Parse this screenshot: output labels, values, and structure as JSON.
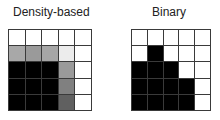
{
  "panels": [
    {
      "title": "Density-based",
      "rows": 5,
      "cols": 5,
      "cells": [
        [
          "#ffffff",
          "#ffffff",
          "#ffffff",
          "#ffffff",
          "#ffffff"
        ],
        [
          "#a8a8a8",
          "#9a9a9a",
          "#a6a6a6",
          "#ececec",
          "#ffffff"
        ],
        [
          "#000000",
          "#000000",
          "#000000",
          "#9a9a9a",
          "#ffffff"
        ],
        [
          "#000000",
          "#000000",
          "#000000",
          "#808080",
          "#ffffff"
        ],
        [
          "#000000",
          "#000000",
          "#000000",
          "#606060",
          "#ffffff"
        ]
      ]
    },
    {
      "title": "Binary",
      "rows": 5,
      "cols": 5,
      "cells": [
        [
          "#ffffff",
          "#ffffff",
          "#ffffff",
          "#ffffff",
          "#ffffff"
        ],
        [
          "#ffffff",
          "#000000",
          "#ffffff",
          "#ffffff",
          "#ffffff"
        ],
        [
          "#000000",
          "#000000",
          "#000000",
          "#ffffff",
          "#ffffff"
        ],
        [
          "#000000",
          "#000000",
          "#000000",
          "#000000",
          "#ffffff"
        ],
        [
          "#000000",
          "#000000",
          "#000000",
          "#000000",
          "#ffffff"
        ]
      ]
    }
  ]
}
